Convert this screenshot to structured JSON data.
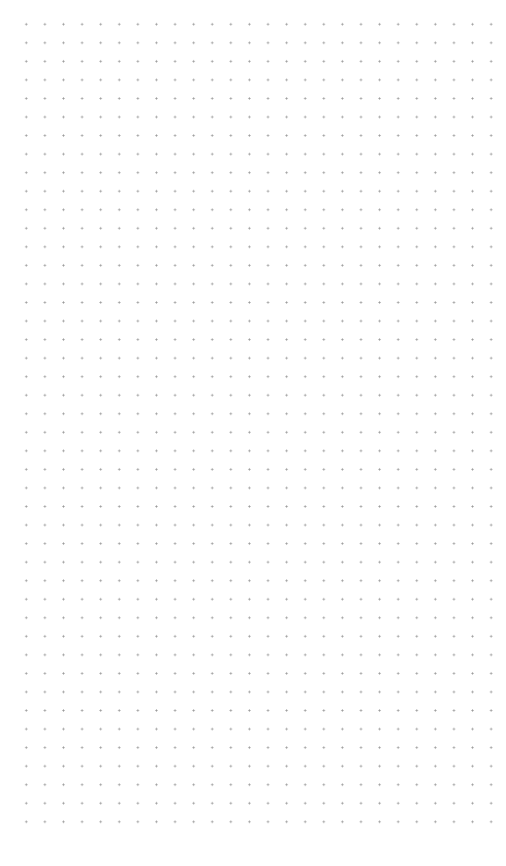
{
  "canvas": {
    "background": "#ffffff",
    "pattern": "dot-grid",
    "dot_color": "#9a9a9a",
    "spacing_px": 18.6,
    "columns": 26,
    "rows": 44
  }
}
